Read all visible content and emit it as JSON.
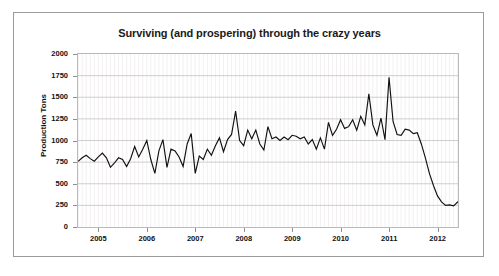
{
  "chart_data": {
    "type": "line",
    "title": "Surviving (and prospering) through the crazy years",
    "xlabel": "",
    "ylabel": "Production Tons",
    "ylim": [
      0,
      2000
    ],
    "xlim": [
      2004.58,
      2012.42
    ],
    "ytick_values": [
      0,
      250,
      500,
      750,
      1000,
      1250,
      1500,
      1750,
      2000
    ],
    "ytick_labels": [
      "0",
      "250",
      "500",
      "750",
      "1000",
      "1250",
      "1500",
      "1750",
      "2000"
    ],
    "xtick_values": [
      2005,
      2006,
      2007,
      2008,
      2009,
      2010,
      2011,
      2012
    ],
    "xtick_labels": [
      "2005",
      "2006",
      "2007",
      "2008",
      "2009",
      "2010",
      "2011",
      "2012"
    ],
    "grid": "horizontal-major-and-vertical-minor",
    "legend": "none",
    "line_color": "#111111",
    "frame_color": "#9a9a9a",
    "series": [
      {
        "name": "Production Tons",
        "x_start": 2004.583,
        "x_step": 0.0833,
        "values": [
          760,
          800,
          830,
          790,
          760,
          810,
          855,
          800,
          690,
          740,
          800,
          780,
          700,
          790,
          930,
          810,
          900,
          1000,
          780,
          620,
          880,
          1010,
          690,
          900,
          880,
          810,
          700,
          960,
          1080,
          620,
          820,
          780,
          900,
          830,
          940,
          1030,
          870,
          1010,
          1070,
          1340,
          1000,
          940,
          1120,
          1020,
          1120,
          960,
          890,
          1160,
          1020,
          1040,
          1000,
          1040,
          1010,
          1060,
          1050,
          1020,
          1040,
          960,
          1010,
          900,
          1030,
          900,
          1210,
          1060,
          1130,
          1240,
          1140,
          1160,
          1240,
          1120,
          1280,
          1180,
          1540,
          1180,
          1060,
          1260,
          1010,
          1730,
          1220,
          1070,
          1060,
          1130,
          1120,
          1080,
          1090,
          960,
          800,
          620,
          480,
          360,
          290,
          250,
          255,
          245,
          290,
          280,
          215,
          270,
          300,
          315,
          450,
          480,
          400,
          530,
          600,
          700,
          940,
          800,
          740,
          860,
          830,
          760,
          1040,
          790,
          850,
          900,
          800,
          870,
          700,
          790,
          880,
          900,
          1080,
          850,
          830,
          760,
          860,
          1140,
          930,
          800,
          1010,
          870,
          1080,
          770,
          1120,
          610,
          830,
          850,
          870,
          1010,
          1160,
          1090,
          1120,
          1200,
          1180,
          1100,
          1000,
          940,
          880,
          1030,
          960,
          840,
          750
        ]
      }
    ]
  },
  "chart": {
    "title": "Surviving (and prospering) through the crazy years",
    "y_axis_title": "Production Tons"
  }
}
